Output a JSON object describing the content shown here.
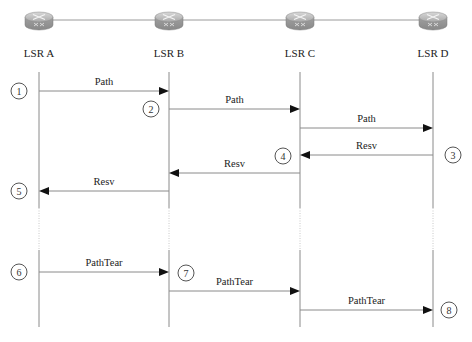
{
  "diagram": {
    "type": "sequence",
    "colors": {
      "line": "#8a8a8a",
      "arrow": "#111111",
      "router_body": "#9a9a9a",
      "text": "#222222"
    },
    "nodes": [
      {
        "id": "A",
        "label": "LSR A",
        "x": 39,
        "icon": "router-icon"
      },
      {
        "id": "B",
        "label": "LSR B",
        "x": 169,
        "icon": "router-icon"
      },
      {
        "id": "C",
        "label": "LSR C",
        "x": 300,
        "icon": "router-icon"
      },
      {
        "id": "D",
        "label": "LSR D",
        "x": 433,
        "icon": "router-icon"
      }
    ],
    "lifeline": {
      "top": 72,
      "bottom": 327,
      "dotted_from": 208,
      "dotted_to": 250
    },
    "messages": [
      {
        "label": "Path",
        "from": "A",
        "to": "B",
        "y": 91
      },
      {
        "label": "Path",
        "from": "B",
        "to": "C",
        "y": 109
      },
      {
        "label": "Path",
        "from": "C",
        "to": "D",
        "y": 128
      },
      {
        "label": "Resv",
        "from": "D",
        "to": "C",
        "y": 155
      },
      {
        "label": "Resv",
        "from": "C",
        "to": "B",
        "y": 173
      },
      {
        "label": "Resv",
        "from": "B",
        "to": "A",
        "y": 191
      },
      {
        "label": "PathTear",
        "from": "A",
        "to": "B",
        "y": 272
      },
      {
        "label": "PathTear",
        "from": "B",
        "to": "C",
        "y": 291
      },
      {
        "label": "PathTear",
        "from": "C",
        "to": "D",
        "y": 310
      }
    ],
    "steps": [
      {
        "num": "1",
        "x": 19,
        "y": 91
      },
      {
        "num": "2",
        "x": 151,
        "y": 109
      },
      {
        "num": "3",
        "x": 453,
        "y": 155
      },
      {
        "num": "4",
        "x": 283,
        "y": 156
      },
      {
        "num": "5",
        "x": 19,
        "y": 191
      },
      {
        "num": "6",
        "x": 19,
        "y": 272
      },
      {
        "num": "7",
        "x": 186,
        "y": 273
      },
      {
        "num": "8",
        "x": 449,
        "y": 310
      }
    ]
  }
}
